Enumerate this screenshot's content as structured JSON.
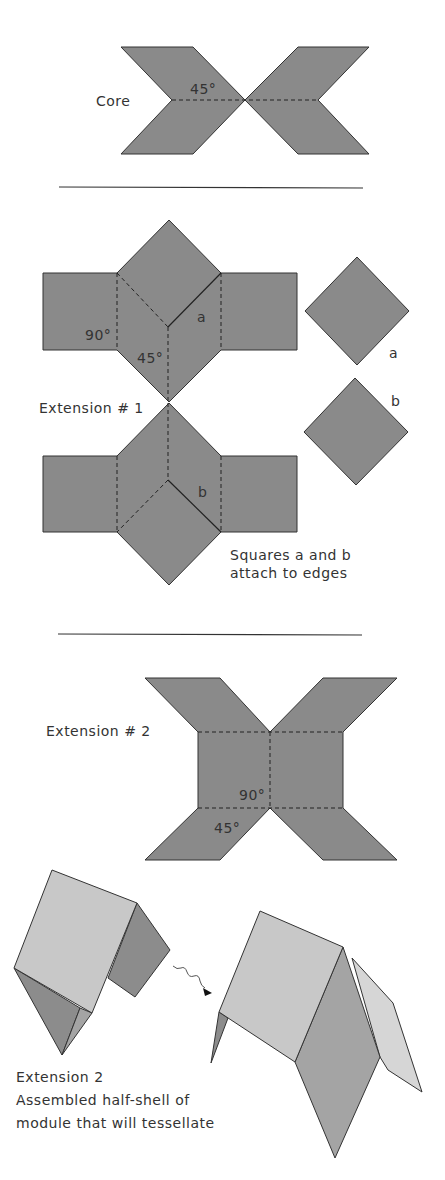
{
  "colors": {
    "paper_fill": "#8a8a8a",
    "light_face": "#c8c8c8",
    "mid_face": "#a4a4a4",
    "dark_face": "#8c8c8c",
    "line": "#333333",
    "background": "#ffffff"
  },
  "core": {
    "label": "Core",
    "angle": "45°"
  },
  "extension1": {
    "label": "Extension # 1",
    "angle_90": "90°",
    "angle_45": "45°",
    "edge_a": "a",
    "edge_b": "b",
    "square_a_label": "a",
    "square_b_label": "b",
    "note_line1": "Squares a and b",
    "note_line2": "attach to edges"
  },
  "extension2": {
    "label": "Extension # 2",
    "angle_90": "90°",
    "angle_45": "45°"
  },
  "assembled": {
    "line1": "Extension  2",
    "line2": "Assembled half-shell of",
    "line3": "module that will tessellate"
  }
}
